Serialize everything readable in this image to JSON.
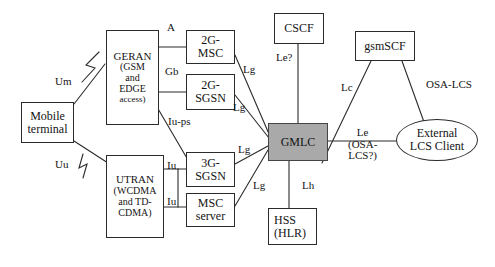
{
  "diagram": {
    "colors": {
      "stroke": "#2b2b2b",
      "text": "#141414",
      "gmlc_fill": "#a9a9a9",
      "background": "#ffffff"
    },
    "nodes": [
      {
        "id": "mobile-terminal",
        "shape": "rect",
        "lines": [
          "Mobile",
          "terminal"
        ],
        "x": 21,
        "y": 102,
        "w": 53,
        "h": 41,
        "filled": false
      },
      {
        "id": "geran",
        "shape": "rect",
        "lines": [
          "GERAN",
          "(GSM",
          "and",
          "EDGE",
          "access)"
        ],
        "x": 106,
        "y": 30,
        "w": 53,
        "h": 95,
        "filled": false
      },
      {
        "id": "utran",
        "shape": "rect",
        "lines": [
          "UTRAN",
          "(WCDMA",
          "and TD-",
          "CDMA)"
        ],
        "x": 106,
        "y": 155,
        "w": 58,
        "h": 83,
        "filled": false
      },
      {
        "id": "2g-msc",
        "shape": "rect",
        "lines": [
          "2G-",
          "MSC"
        ],
        "x": 186,
        "y": 30,
        "w": 49,
        "h": 34,
        "filled": false
      },
      {
        "id": "2g-sgsn",
        "shape": "rect",
        "lines": [
          "2G-",
          "SGSN"
        ],
        "x": 186,
        "y": 74,
        "w": 49,
        "h": 36,
        "filled": false
      },
      {
        "id": "3g-sgsn",
        "shape": "rect",
        "lines": [
          "3G-",
          "SGSN"
        ],
        "x": 186,
        "y": 152,
        "w": 49,
        "h": 35,
        "filled": false
      },
      {
        "id": "msc-server",
        "shape": "rect",
        "lines": [
          "MSC",
          "server"
        ],
        "x": 186,
        "y": 193,
        "w": 49,
        "h": 34,
        "filled": false
      },
      {
        "id": "cscf",
        "shape": "rect",
        "lines": [
          "CSCF"
        ],
        "x": 274,
        "y": 13,
        "w": 50,
        "h": 31,
        "filled": false
      },
      {
        "id": "gsmscf",
        "shape": "rect",
        "lines": [
          "gsmSCF"
        ],
        "x": 355,
        "y": 31,
        "w": 60,
        "h": 30,
        "filled": false
      },
      {
        "id": "gmlc",
        "shape": "rect",
        "lines": [
          "GMLC"
        ],
        "x": 268,
        "y": 123,
        "w": 60,
        "h": 38,
        "filled": true
      },
      {
        "id": "hss",
        "shape": "rect",
        "lines": [
          "HSS",
          "(HLR)"
        ],
        "x": 268,
        "y": 208,
        "w": 49,
        "h": 37,
        "filled": false
      },
      {
        "id": "external-lcs-client",
        "shape": "ellipse",
        "lines": [
          "External",
          "LCS Client"
        ],
        "x": 396,
        "y": 119,
        "w": 82,
        "h": 42,
        "filled": false
      }
    ],
    "edge_labels": [
      {
        "id": "um",
        "text": "Um",
        "x": 55,
        "y": 76,
        "size": "fs11"
      },
      {
        "id": "uu",
        "text": "Uu",
        "x": 55,
        "y": 159,
        "size": "fs11"
      },
      {
        "id": "a",
        "text": "A",
        "x": 167,
        "y": 22,
        "size": "fs11"
      },
      {
        "id": "gb",
        "text": "Gb",
        "x": 165,
        "y": 66,
        "size": "fs11"
      },
      {
        "id": "iu-ps",
        "text": "Iu-ps",
        "x": 168,
        "y": 116,
        "size": "fs11"
      },
      {
        "id": "iu-1",
        "text": "Iu",
        "x": 168,
        "y": 160,
        "size": "fs11"
      },
      {
        "id": "iu-2",
        "text": "Iu",
        "x": 168,
        "y": 196,
        "size": "fs11"
      },
      {
        "id": "lg-1",
        "text": "Lg",
        "x": 243,
        "y": 64,
        "size": "fs11"
      },
      {
        "id": "lg-2",
        "text": "Lg",
        "x": 233,
        "y": 102,
        "size": "fs11"
      },
      {
        "id": "lg-3",
        "text": "Lg",
        "x": 238,
        "y": 144,
        "size": "fs11"
      },
      {
        "id": "lg-4",
        "text": "Lg",
        "x": 253,
        "y": 180,
        "size": "fs11"
      },
      {
        "id": "le-q",
        "text": "Le?",
        "x": 276,
        "y": 52,
        "size": "fs11"
      },
      {
        "id": "lc",
        "text": "Lc",
        "x": 341,
        "y": 82,
        "size": "fs11"
      },
      {
        "id": "lh",
        "text": "Lh",
        "x": 302,
        "y": 180,
        "size": "fs11"
      },
      {
        "id": "osa-lcs",
        "text": "OSA-LCS",
        "x": 426,
        "y": 79,
        "size": "fs11"
      }
    ],
    "le_block": {
      "id": "le-osa-lcs",
      "lines": [
        "Le",
        "(OSA-",
        "LCS?)"
      ],
      "x": 348,
      "y": 127
    },
    "connectors": [
      {
        "id": "geran-2gmsc",
        "from": "GERAN",
        "to": "2G-MSC",
        "label": "A"
      },
      {
        "id": "geran-2gsgsn",
        "from": "GERAN",
        "to": "2G-SGSN",
        "label": "Gb"
      },
      {
        "id": "geran-3gsgsn",
        "from": "GERAN",
        "to": "3G-SGSN",
        "label": "Iu-ps"
      },
      {
        "id": "utran-3gsgsn",
        "from": "UTRAN",
        "to": "3G-SGSN",
        "label": "Iu"
      },
      {
        "id": "utran-mscserver",
        "from": "UTRAN",
        "to": "MSC server",
        "label": "Iu"
      },
      {
        "id": "2gmsc-gmlc",
        "from": "2G-MSC",
        "to": "GMLC",
        "label": "Lg"
      },
      {
        "id": "2gsgsn-gmlc",
        "from": "2G-SGSN",
        "to": "GMLC",
        "label": "Lg"
      },
      {
        "id": "3gsgsn-gmlc",
        "from": "3G-SGSN",
        "to": "GMLC",
        "label": "Lg"
      },
      {
        "id": "mscserver-gmlc",
        "from": "MSC server",
        "to": "GMLC",
        "label": "Lg"
      },
      {
        "id": "cscf-gmlc",
        "from": "CSCF",
        "to": "GMLC",
        "label": "Le?"
      },
      {
        "id": "gsmscf-gmlc",
        "from": "gsmSCF",
        "to": "GMLC",
        "label": "Lc"
      },
      {
        "id": "gsmscf-client",
        "from": "gsmSCF",
        "to": "External LCS Client",
        "label": "OSA-LCS"
      },
      {
        "id": "gmlc-client",
        "from": "GMLC",
        "to": "External LCS Client",
        "label": "Le (OSA-LCS?)"
      },
      {
        "id": "gmlc-hss",
        "from": "GMLC",
        "to": "HSS (HLR)",
        "label": "Lh"
      },
      {
        "id": "mt-geran",
        "from": "Mobile terminal",
        "to": "GERAN",
        "label": "Um"
      },
      {
        "id": "mt-utran",
        "from": "Mobile terminal",
        "to": "UTRAN",
        "label": "Uu"
      }
    ]
  }
}
